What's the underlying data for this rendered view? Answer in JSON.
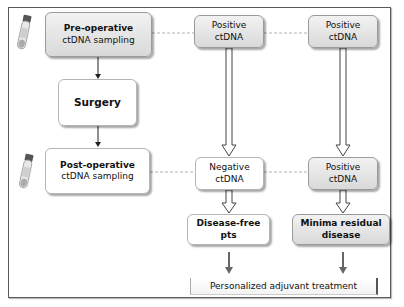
{
  "diagram": {
    "nodes": {
      "pre_operative": {
        "line1": "Pre-operative",
        "line2": "ctDNA sampling"
      },
      "surgery": {
        "label": "Surgery"
      },
      "post_operative": {
        "line1": "Post-operative",
        "line2": "ctDNA sampling"
      },
      "positive_1": {
        "line1": "Positive",
        "line2": "ctDNA"
      },
      "positive_2": {
        "line1": "Positive",
        "line2": "ctDNA"
      },
      "negative": {
        "line1": "Negative",
        "line2": "ctDNA"
      },
      "positive_3": {
        "line1": "Positive",
        "line2": "ctDNA"
      },
      "disease_free": {
        "line1": "Disease-free",
        "line2": "pts"
      },
      "minimal_residual": {
        "line1": "Minima residual",
        "line2": "disease"
      },
      "treatment": {
        "label": "Personalized adjuvant treatment"
      }
    },
    "icons": [
      "blood-tube-icon",
      "blood-tube-icon"
    ],
    "colors": {
      "gray_box": "#dedede",
      "white_box": "#ffffff",
      "border": "#5a5a5a",
      "dashed_line": "#b0b0b0"
    }
  }
}
